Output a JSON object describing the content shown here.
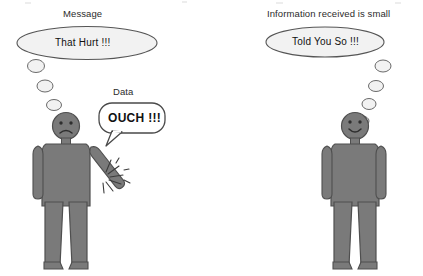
{
  "scene": {
    "title_note": "Two stick figures illustrating message loss between sender and receiver",
    "background_color": "#ffffff",
    "figure_body_color": "#7a7a7a",
    "figure_outline_color": "#4f4f4f",
    "bubble_fill_color": "#f2f2f2",
    "bubble_outline_color": "#555555",
    "speech_bubble_fill_color": "#ffffff",
    "text_color": "#111111",
    "label_color": "#2b2b2b"
  },
  "left_side": {
    "label": "Message",
    "thought_text": "That Hurt !!!",
    "speech_label": "Data",
    "speech_text": "OUCH !!!",
    "figure_name": "sender-figure",
    "expression": "frowning",
    "pain_burst": "pain-burst-icon",
    "trail_dots": 4
  },
  "right_side": {
    "label": "Information received is small",
    "thought_text": "Told You So !!!",
    "figure_name": "receiver-figure",
    "expression": "smiling",
    "trail_dots": 4
  }
}
